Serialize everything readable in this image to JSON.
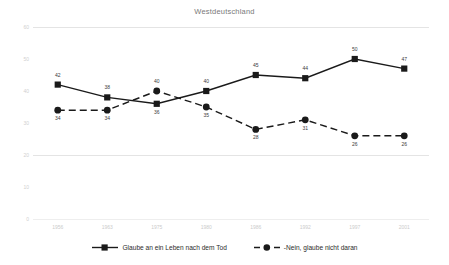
{
  "chart_data": {
    "type": "line",
    "title": "Westdeutschland",
    "xlabel": "",
    "ylabel": "",
    "categories": [
      "1956",
      "1963",
      "1975",
      "1980",
      "1986",
      "1992",
      "1997",
      "2001"
    ],
    "ylim": [
      0,
      60
    ],
    "yticks": [
      "0",
      "10",
      "20",
      "30",
      "40",
      "50",
      "60"
    ],
    "grid": "horizontal-faint",
    "legend_position": "bottom",
    "series": [
      {
        "name": "Glaube an ein Leben nach dem Tod",
        "marker": "square",
        "line": "solid",
        "color": "#1a1a1a",
        "values": [
          42,
          38,
          36,
          40,
          45,
          44,
          50,
          47
        ],
        "label_side": [
          "above",
          "above",
          "below",
          "above",
          "above",
          "above",
          "above",
          "above"
        ]
      },
      {
        "name": "-Nein, glaube nicht daran",
        "marker": "circle",
        "line": "dashed",
        "color": "#1a1a1a",
        "values": [
          34,
          34,
          40,
          35,
          28,
          31,
          26,
          26
        ],
        "label_side": [
          "below",
          "below",
          "above",
          "below",
          "below",
          "below",
          "below",
          "below"
        ]
      }
    ]
  }
}
